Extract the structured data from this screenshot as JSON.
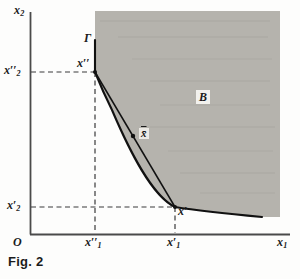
{
  "figure": {
    "caption": "Fig. 2",
    "axes": {
      "x_label": "x",
      "x_label_sub": "1",
      "y_label": "x",
      "y_label_sub": "2",
      "origin_label": "O"
    },
    "ticks": {
      "y_upper": {
        "base": "x",
        "prime": "′′",
        "sub": "2"
      },
      "y_lower": {
        "base": "x",
        "prime": "′",
        "sub": "2"
      },
      "x_left": {
        "base": "x",
        "prime": "′′",
        "sub": "1"
      },
      "x_right": {
        "base": "x",
        "prime": "′",
        "sub": "1"
      }
    },
    "annotations": {
      "curve_label": "Γ",
      "region_label": "B",
      "point_upper": {
        "base": "x",
        "prime": "′′"
      },
      "point_lower": {
        "base": "x",
        "prime": "′"
      },
      "point_mid": "x̄"
    },
    "colors": {
      "region_fill": "#b5b3ad",
      "curve_stroke": "#111111",
      "axis_stroke": "#4a4a4a",
      "dash_stroke": "#3a3a3a",
      "label_color": "#1b1b1b",
      "page_background": "#fdfdfc"
    },
    "geometry": {
      "x_axis_y": 234,
      "y_axis_x": 30,
      "x_axis_end": 290,
      "y_axis_top": 12,
      "region_top": 11,
      "region_right": 280,
      "point_upper_xy": [
        95,
        72
      ],
      "point_lower_xy": [
        175,
        207
      ],
      "point_mid_xy": [
        136,
        140
      ],
      "curve_start_xy": [
        95,
        40
      ],
      "curve_end_xy": [
        262,
        217
      ]
    }
  }
}
